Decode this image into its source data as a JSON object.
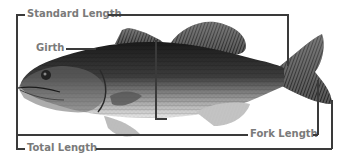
{
  "diagram": {
    "labels": {
      "standard_length": "Standard Length",
      "girth": "Girth",
      "fork_length": "Fork Length",
      "total_length": "Total Length"
    },
    "colors": {
      "label_text": "#7a7a7a",
      "lines": "#3a3a3a",
      "background": "#ffffff"
    }
  }
}
